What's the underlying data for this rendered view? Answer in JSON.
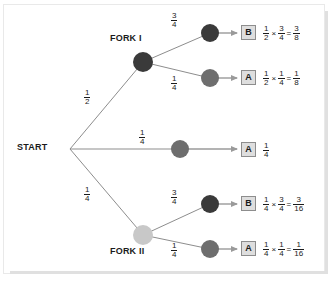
{
  "diagram": {
    "type": "probability-tree",
    "title": "",
    "root": {
      "label": "START"
    },
    "forks": [
      {
        "id": "fork-1",
        "label": "FORK I"
      },
      {
        "id": "fork-2",
        "label": "FORK II"
      }
    ],
    "colors": {
      "node_dark": "#3a3a3a",
      "node_medium": "#6e6e6e",
      "node_light": "#c8c8c8",
      "edge": "#8d8d8d",
      "arrow": "#9a9a9a",
      "outcome_box_fill": "#dedede",
      "outcome_box_border": "#8d8d8d",
      "text": "#1b1b1b",
      "frame_border": "#e9e9e9",
      "background": "#ffffff"
    },
    "branch_probabilities": {
      "start_to_fork1": {
        "num": "1",
        "den": "2"
      },
      "start_to_middle": {
        "num": "1",
        "den": "4"
      },
      "start_to_fork2": {
        "num": "1",
        "den": "4"
      },
      "fork1_upper": {
        "num": "3",
        "den": "4"
      },
      "fork1_lower": {
        "num": "1",
        "den": "4"
      },
      "fork2_upper": {
        "num": "3",
        "den": "4"
      },
      "fork2_lower": {
        "num": "1",
        "den": "4"
      }
    },
    "outcomes": [
      {
        "id": "outcome-1",
        "box_label": "B",
        "node_color": "node_dark",
        "expression": {
          "factors": [
            {
              "num": "1",
              "den": "2"
            },
            {
              "num": "3",
              "den": "4"
            }
          ],
          "operator": "×",
          "equals": "=",
          "result": {
            "num": "3",
            "den": "8"
          }
        }
      },
      {
        "id": "outcome-2",
        "box_label": "A",
        "node_color": "node_medium",
        "expression": {
          "factors": [
            {
              "num": "1",
              "den": "2"
            },
            {
              "num": "1",
              "den": "4"
            }
          ],
          "operator": "×",
          "equals": "=",
          "result": {
            "num": "1",
            "den": "8"
          }
        }
      },
      {
        "id": "outcome-3",
        "box_label": "A",
        "node_color": "node_medium",
        "expression": {
          "factors": [],
          "operator": "",
          "equals": "",
          "result": {
            "num": "1",
            "den": "4"
          }
        }
      },
      {
        "id": "outcome-4",
        "box_label": "B",
        "node_color": "node_dark",
        "expression": {
          "factors": [
            {
              "num": "1",
              "den": "4"
            },
            {
              "num": "3",
              "den": "4"
            }
          ],
          "operator": "×",
          "equals": "=",
          "result": {
            "num": "3",
            "den": "16"
          }
        }
      },
      {
        "id": "outcome-5",
        "box_label": "A",
        "node_color": "node_medium",
        "expression": {
          "factors": [
            {
              "num": "1",
              "den": "4"
            },
            {
              "num": "1",
              "den": "4"
            }
          ],
          "operator": "×",
          "equals": "=",
          "result": {
            "num": "1",
            "den": "16"
          }
        }
      }
    ]
  }
}
